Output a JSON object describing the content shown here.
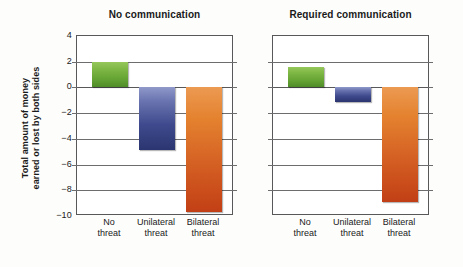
{
  "chart_data": {
    "type": "bar",
    "title": "",
    "xlabel": "",
    "ylabel": "Total amount of money earned or lost by both sides",
    "ylabel_line1": "Total amount of money",
    "ylabel_line2": "earned or lost by both sides",
    "ylim": [
      -10,
      4
    ],
    "yticks": [
      4,
      2,
      0,
      -2,
      -4,
      -6,
      -8,
      -10
    ],
    "ytick_labels": [
      "4",
      "2",
      "0",
      "−2",
      "−4",
      "−6",
      "−8",
      "−10"
    ],
    "grid": true,
    "legend": "none",
    "categories": [
      "No threat",
      "Unilateral threat",
      "Bilateral threat"
    ],
    "category_lines": [
      {
        "l1": "No",
        "l2": "threat"
      },
      {
        "l1": "Unilateral",
        "l2": "threat"
      },
      {
        "l1": "Bilateral",
        "l2": "threat"
      }
    ],
    "panels": [
      {
        "title": "No communication",
        "values": [
          2.0,
          -4.9,
          -9.7
        ],
        "colors": [
          "#63a233",
          "#3e4a8d",
          "#d35d22"
        ]
      },
      {
        "title": "Required communication",
        "values": [
          1.6,
          -1.1,
          -8.9
        ],
        "colors": [
          "#63a233",
          "#3e4a8d",
          "#d35d22"
        ]
      }
    ],
    "series_colors": {
      "no_threat": "#63a233",
      "unilateral_threat": "#3e4a8d",
      "bilateral_threat": "#d35d22"
    },
    "axis_color": "#58585a",
    "grid_color": "#6d6d6f",
    "background": "#ffffff"
  }
}
